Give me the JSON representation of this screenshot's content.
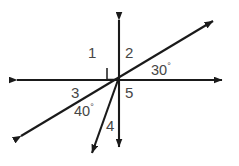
{
  "figure": {
    "stroke_color": "#1a1a1a",
    "label_color": "#464646",
    "background": "#ffffff",
    "width": 239,
    "height": 166
  },
  "labels": {
    "angle1": "1",
    "angle2": "2",
    "angle3": "3",
    "angle4": "4",
    "angle5": "5",
    "measure_right": "30",
    "measure_left": "40",
    "degree_symbol": "°"
  },
  "elements": {
    "horizontal_line": "horizontal-double-arrow-line",
    "vertical_line": "vertical-double-arrow-line",
    "diagonal_line": "diagonal-double-arrow-line",
    "short_ray": "short-ray-down-left",
    "right_angle_marker": "right-angle-square"
  },
  "geometry": {
    "vertex_x": 118,
    "vertex_y": 80,
    "diagonal_angle_deg": 30,
    "ray_angle_from_vertical_deg": 20
  }
}
